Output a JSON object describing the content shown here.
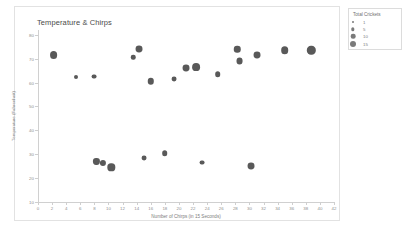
{
  "card": {
    "title": "Temperature & Chirps"
  },
  "legend": {
    "title": "Total Crickets",
    "entries": [
      {
        "label": "1",
        "size": 2.0
      },
      {
        "label": "5",
        "size": 3.4
      },
      {
        "label": "10",
        "size": 4.6
      },
      {
        "label": "15",
        "size": 6.0
      }
    ]
  },
  "chart_data": {
    "type": "scatter",
    "title": "Temperature & Chirps",
    "xlabel": "Number of Chirps (in 15 Seconds)",
    "ylabel": "Temperature (Fahrenheit)",
    "xlim": [
      0,
      42
    ],
    "ylim": [
      10,
      82
    ],
    "grid": false,
    "legend_position": "outside-right",
    "size_legend": {
      "title": "Total Crickets",
      "values": [
        1,
        5,
        10,
        15
      ]
    },
    "xticks": [
      0,
      2,
      4,
      6,
      8,
      10,
      12,
      14,
      16,
      18,
      20,
      22,
      24,
      26,
      28,
      30,
      32,
      34,
      36,
      38,
      40,
      42
    ],
    "yticks": [
      10,
      20,
      30,
      40,
      50,
      60,
      70,
      80
    ],
    "series": [
      {
        "name": "Crickets",
        "points": [
          {
            "x": 2.2,
            "y": 71.5,
            "size": 15
          },
          {
            "x": 5.4,
            "y": 62.5,
            "size": 2
          },
          {
            "x": 7.9,
            "y": 62.5,
            "size": 4
          },
          {
            "x": 8.3,
            "y": 27.0,
            "size": 8
          },
          {
            "x": 9.2,
            "y": 26.5,
            "size": 8
          },
          {
            "x": 10.4,
            "y": 24.5,
            "size": 13
          },
          {
            "x": 13.5,
            "y": 70.5,
            "size": 3
          },
          {
            "x": 14.4,
            "y": 74.0,
            "size": 11
          },
          {
            "x": 16.0,
            "y": 60.5,
            "size": 9
          },
          {
            "x": 15.1,
            "y": 28.5,
            "size": 4
          },
          {
            "x": 18.0,
            "y": 30.5,
            "size": 6
          },
          {
            "x": 19.3,
            "y": 61.5,
            "size": 4
          },
          {
            "x": 21.0,
            "y": 66.0,
            "size": 11
          },
          {
            "x": 22.4,
            "y": 66.5,
            "size": 15
          },
          {
            "x": 23.3,
            "y": 26.5,
            "size": 4
          },
          {
            "x": 25.5,
            "y": 63.5,
            "size": 6
          },
          {
            "x": 28.3,
            "y": 74.0,
            "size": 9
          },
          {
            "x": 28.6,
            "y": 69.0,
            "size": 11
          },
          {
            "x": 31.1,
            "y": 71.5,
            "size": 11
          },
          {
            "x": 30.2,
            "y": 25.0,
            "size": 11
          },
          {
            "x": 35.0,
            "y": 73.5,
            "size": 14
          },
          {
            "x": 38.8,
            "y": 73.5,
            "size": 18
          }
        ]
      }
    ]
  }
}
